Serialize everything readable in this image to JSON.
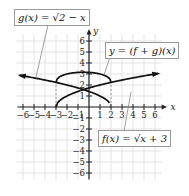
{
  "chart_data": {
    "type": "line",
    "title": "",
    "xlabel": "x",
    "ylabel": "y",
    "xlim": [
      -6,
      6
    ],
    "ylim": [
      -6,
      6
    ],
    "grid": true,
    "x_ticks": [
      "-6",
      "-5",
      "-4",
      "-3",
      "-2",
      "-1",
      "1",
      "2",
      "3",
      "4",
      "5",
      "6"
    ],
    "y_ticks": [
      "6",
      "5",
      "4",
      "3",
      "2",
      "1",
      "-1",
      "-2",
      "-3",
      "-4",
      "-5",
      "-6"
    ],
    "series": [
      {
        "name": "g(x) = √(2 − x)",
        "domain": "x ≤ 2",
        "points": [
          [
            -6.5,
            2.92
          ],
          [
            -6,
            2.83
          ],
          [
            -3,
            2.24
          ],
          [
            -2,
            2
          ],
          [
            -0.5,
            1.58
          ],
          [
            0,
            1.41
          ],
          [
            1,
            1
          ],
          [
            2,
            0
          ]
        ]
      },
      {
        "name": "f(x) = √(x + 3)",
        "domain": "x ≥ −3",
        "points": [
          [
            -3,
            0
          ],
          [
            -2,
            1
          ],
          [
            -0.5,
            1.58
          ],
          [
            0,
            1.73
          ],
          [
            1,
            2
          ],
          [
            2,
            2.24
          ],
          [
            3,
            2.45
          ],
          [
            6,
            3
          ],
          [
            6.5,
            3.08
          ]
        ]
      },
      {
        "name": "y = (f + g)(x)",
        "domain": "−3 ≤ x ≤ 2",
        "points": [
          [
            -3,
            2.24
          ],
          [
            -2.5,
            2.83
          ],
          [
            -2,
            3
          ],
          [
            -1,
            3.15
          ],
          [
            -0.5,
            3.16
          ],
          [
            0,
            3.15
          ],
          [
            1,
            3
          ],
          [
            1.5,
            2.83
          ],
          [
            2,
            2.24
          ]
        ]
      }
    ],
    "annotations": [
      "g(x) = √(2 − x)",
      "y = (f + g)(x)",
      "f(x) = √(x + 3)"
    ]
  },
  "labels": {
    "g": "g(x) = √2 − x",
    "fg": "y = (f + g)(x)",
    "f": "f(x) = √x + 3",
    "x_axis": "x",
    "y_axis": "y"
  }
}
